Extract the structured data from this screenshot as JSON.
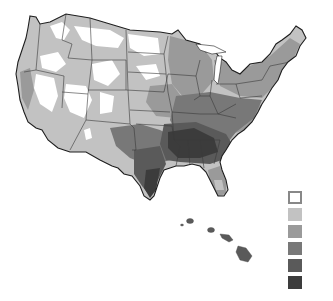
{
  "map": {
    "title": "",
    "subject": "Choropleth map of the contiguous United States with Hawaii inset, grayscale classes",
    "regions_shown": [
      "Contiguous United States",
      "Hawaii"
    ],
    "palette": [
      "#ffffff",
      "#c2c2c2",
      "#9a9a9a",
      "#787878",
      "#5a5a5a",
      "#3c3c3c"
    ],
    "border_color": "#2a2a2a",
    "legend": {
      "classes": [
        {
          "index": 0,
          "color": "#ffffff",
          "label": ""
        },
        {
          "index": 1,
          "color": "#c2c2c2",
          "label": ""
        },
        {
          "index": 2,
          "color": "#9a9a9a",
          "label": ""
        },
        {
          "index": 3,
          "color": "#787878",
          "label": ""
        },
        {
          "index": 4,
          "color": "#5a5a5a",
          "label": ""
        },
        {
          "index": 5,
          "color": "#3c3c3c",
          "label": ""
        }
      ]
    },
    "caption": "",
    "regional_pattern": {
      "west_mountain": "mostly lightest classes (0-1)",
      "plains_midwest": "middle classes (2-3)",
      "southeast_gulf": "darkest classes (4-5)",
      "texas_east": "dark (4-5)",
      "florida": "medium (2-3)",
      "hawaii": "dark (4)"
    }
  }
}
